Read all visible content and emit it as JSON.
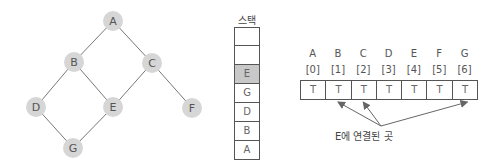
{
  "graph": {
    "nodes": [
      {
        "id": "A",
        "x": 113,
        "y": 21
      },
      {
        "id": "B",
        "x": 74,
        "y": 62
      },
      {
        "id": "C",
        "x": 152,
        "y": 63
      },
      {
        "id": "D",
        "x": 36,
        "y": 107
      },
      {
        "id": "E",
        "x": 113,
        "y": 107
      },
      {
        "id": "F",
        "x": 192,
        "y": 108
      },
      {
        "id": "G",
        "x": 73,
        "y": 148
      }
    ],
    "edges": [
      [
        "A",
        "B"
      ],
      [
        "A",
        "C"
      ],
      [
        "B",
        "D"
      ],
      [
        "B",
        "E"
      ],
      [
        "C",
        "E"
      ],
      [
        "C",
        "F"
      ],
      [
        "D",
        "G"
      ],
      [
        "E",
        "G"
      ]
    ],
    "node_color": "#d6d6d6",
    "edge_color": "#777777"
  },
  "stack": {
    "title": "스택",
    "cells": [
      "",
      "",
      "E",
      "G",
      "D",
      "B",
      "A"
    ],
    "highlight_index": 2,
    "highlight_color": "#c8c8c8"
  },
  "visited": {
    "headers": [
      {
        "name": "A",
        "index": "[0]"
      },
      {
        "name": "B",
        "index": "[1]"
      },
      {
        "name": "C",
        "index": "[2]"
      },
      {
        "name": "D",
        "index": "[3]"
      },
      {
        "name": "E",
        "index": "[4]"
      },
      {
        "name": "F",
        "index": "[5]"
      },
      {
        "name": "G",
        "index": "[6]"
      }
    ],
    "values": [
      "T",
      "T",
      "T",
      "T",
      "T",
      "T",
      "T"
    ],
    "arrow_targets": [
      1,
      2,
      6
    ],
    "caption": "E에 연결된 곳"
  }
}
